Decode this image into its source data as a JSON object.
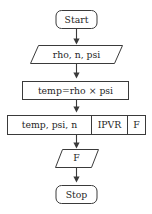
{
  "diagram": {
    "orientation": "top-to-bottom",
    "colors": {
      "background": "#ffffff",
      "stroke": "#3a3a3a",
      "text": "#1f1f1f",
      "fill": "#ffffff"
    },
    "nodes": [
      {
        "id": "start",
        "shape": "rounded-rectangle",
        "label": "Start"
      },
      {
        "id": "input",
        "shape": "parallelogram",
        "label": "rho, n, psi"
      },
      {
        "id": "process",
        "shape": "rectangle",
        "label": "temp=rho × psi"
      },
      {
        "id": "call",
        "shape": "rectangle-split",
        "cells": [
          "temp, psi, n",
          "IPVR",
          "F"
        ]
      },
      {
        "id": "output",
        "shape": "parallelogram",
        "label": "F"
      },
      {
        "id": "stop",
        "shape": "rounded-rectangle",
        "label": "Stop"
      }
    ],
    "edges": [
      {
        "from": "start",
        "to": "input",
        "label": ""
      },
      {
        "from": "input",
        "to": "process",
        "label": ""
      },
      {
        "from": "process",
        "to": "call",
        "label": ""
      },
      {
        "from": "call",
        "to": "output",
        "label": ""
      },
      {
        "from": "output",
        "to": "stop",
        "label": ""
      }
    ]
  }
}
